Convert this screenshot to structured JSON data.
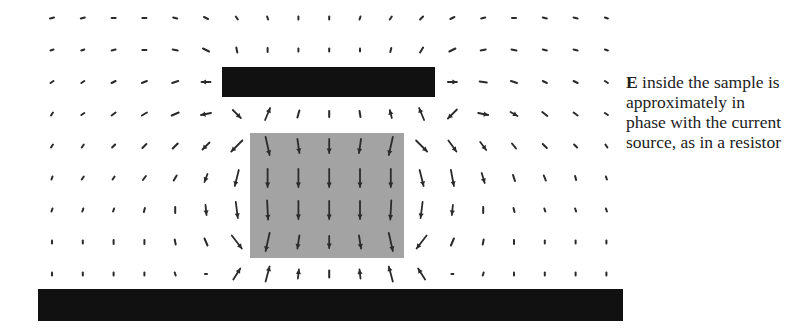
{
  "figure": {
    "caption": {
      "bold_symbol": "E",
      "text": " inside the sample is approximately in phase with the current source, as in a resistor",
      "lines": [
        "E inside the",
        "sample is",
        "approximately",
        "in phase with",
        "the current",
        "source, as in a",
        "resistor"
      ]
    },
    "colors": {
      "plate": "#111111",
      "sample": "#a3a3a3",
      "arrow": "#2a2a2a",
      "background": "#ffffff"
    },
    "top_plate": {
      "x": 222,
      "y": 67,
      "w": 213,
      "h": 30
    },
    "bottom_plate": {
      "x": 38,
      "y": 289,
      "w": 585,
      "h": 32
    },
    "sample": {
      "x": 250,
      "y": 133,
      "w": 154,
      "h": 125
    },
    "grid": {
      "x0": 52,
      "dx": 30.8,
      "cols": 19,
      "y0": 18,
      "dy": 32,
      "rows": 9
    },
    "vectors": [
      [
        [
          -4,
          1
        ],
        [
          -4,
          1
        ],
        [
          -4,
          0
        ],
        [
          -4,
          0
        ],
        [
          -4,
          -1
        ],
        [
          -4,
          -2
        ],
        [
          -2,
          -3
        ],
        [
          -1,
          -3
        ],
        [
          0,
          -3
        ],
        [
          0,
          -3
        ],
        [
          1,
          -3
        ],
        [
          2,
          -3
        ],
        [
          3,
          -3
        ],
        [
          4,
          -2
        ],
        [
          4,
          -1
        ],
        [
          4,
          0
        ],
        [
          4,
          1
        ],
        [
          4,
          1
        ],
        [
          3,
          1
        ]
      ],
      [
        [
          -3,
          1
        ],
        [
          -3,
          1
        ],
        [
          -4,
          1
        ],
        [
          -4,
          0
        ],
        [
          -5,
          -1
        ],
        [
          -6,
          -3
        ],
        [
          -1,
          -5
        ],
        [
          0,
          -4
        ],
        [
          0,
          -3
        ],
        [
          0,
          -3
        ],
        [
          0,
          -3
        ],
        [
          1,
          -4
        ],
        [
          3,
          -5
        ],
        [
          6,
          -3
        ],
        [
          5,
          -1
        ],
        [
          5,
          1
        ],
        [
          4,
          1
        ],
        [
          4,
          1
        ],
        [
          3,
          1
        ]
      ],
      [
        [
          -3,
          2
        ],
        [
          -3,
          2
        ],
        [
          -4,
          2
        ],
        [
          -5,
          2
        ],
        [
          -6,
          2
        ],
        [
          -9,
          0
        ],
        [
          0,
          0
        ],
        [
          0,
          0
        ],
        [
          0,
          0
        ],
        [
          0,
          0
        ],
        [
          0,
          0
        ],
        [
          0,
          0
        ],
        [
          0,
          0
        ],
        [
          9,
          0
        ],
        [
          7,
          1
        ],
        [
          6,
          2
        ],
        [
          4,
          2
        ],
        [
          4,
          2
        ],
        [
          3,
          2
        ]
      ],
      [
        [
          -2,
          3
        ],
        [
          -3,
          2
        ],
        [
          -4,
          3
        ],
        [
          -5,
          3
        ],
        [
          -7,
          3
        ],
        [
          -10,
          2
        ],
        [
          8,
          8
        ],
        [
          5,
          -12
        ],
        [
          2,
          -7
        ],
        [
          0,
          -6
        ],
        [
          -1,
          -6
        ],
        [
          -2,
          -8
        ],
        [
          -5,
          -12
        ],
        [
          -9,
          9
        ],
        [
          10,
          2
        ],
        [
          7,
          4
        ],
        [
          5,
          4
        ],
        [
          4,
          3
        ],
        [
          3,
          2
        ]
      ],
      [
        [
          -2,
          3
        ],
        [
          -2,
          3
        ],
        [
          -3,
          3
        ],
        [
          -4,
          4
        ],
        [
          -5,
          5
        ],
        [
          -7,
          7
        ],
        [
          -11,
          11
        ],
        [
          4,
          18
        ],
        [
          2,
          14
        ],
        [
          0,
          14
        ],
        [
          -2,
          14
        ],
        [
          -4,
          18
        ],
        [
          11,
          11
        ],
        [
          8,
          11
        ],
        [
          6,
          8
        ],
        [
          4,
          5
        ],
        [
          4,
          4
        ],
        [
          3,
          3
        ],
        [
          2,
          3
        ]
      ],
      [
        [
          -1,
          3
        ],
        [
          -2,
          3
        ],
        [
          -2,
          3
        ],
        [
          -3,
          4
        ],
        [
          -3,
          5
        ],
        [
          -3,
          8
        ],
        [
          -4,
          16
        ],
        [
          0,
          18
        ],
        [
          0,
          18
        ],
        [
          0,
          18
        ],
        [
          0,
          18
        ],
        [
          0,
          18
        ],
        [
          4,
          16
        ],
        [
          3,
          16
        ],
        [
          3,
          10
        ],
        [
          2,
          6
        ],
        [
          2,
          5
        ],
        [
          1,
          4
        ],
        [
          1,
          3
        ]
      ],
      [
        [
          -1,
          3
        ],
        [
          -1,
          3
        ],
        [
          -1,
          3
        ],
        [
          -1,
          4
        ],
        [
          0,
          6
        ],
        [
          1,
          10
        ],
        [
          2,
          16
        ],
        [
          1,
          19
        ],
        [
          0,
          18
        ],
        [
          0,
          18
        ],
        [
          0,
          18
        ],
        [
          -1,
          19
        ],
        [
          -2,
          16
        ],
        [
          -1,
          10
        ],
        [
          0,
          6
        ],
        [
          1,
          4
        ],
        [
          1,
          3
        ],
        [
          1,
          3
        ],
        [
          1,
          3
        ]
      ],
      [
        [
          0,
          3
        ],
        [
          0,
          3
        ],
        [
          0,
          4
        ],
        [
          0,
          4
        ],
        [
          1,
          5
        ],
        [
          3,
          7
        ],
        [
          10,
          13
        ],
        [
          -4,
          18
        ],
        [
          -2,
          13
        ],
        [
          0,
          12
        ],
        [
          2,
          13
        ],
        [
          4,
          18
        ],
        [
          -10,
          13
        ],
        [
          -3,
          7
        ],
        [
          -1,
          5
        ],
        [
          0,
          4
        ],
        [
          0,
          3
        ],
        [
          0,
          3
        ],
        [
          0,
          3
        ]
      ],
      [
        [
          0,
          3
        ],
        [
          0,
          3
        ],
        [
          0,
          3
        ],
        [
          0,
          3
        ],
        [
          1,
          3
        ],
        [
          -2,
          0
        ],
        [
          7,
          -11
        ],
        [
          4,
          -15
        ],
        [
          1,
          -9
        ],
        [
          0,
          -7
        ],
        [
          -1,
          -9
        ],
        [
          -4,
          -15
        ],
        [
          -7,
          -11
        ],
        [
          2,
          0
        ],
        [
          -1,
          3
        ],
        [
          0,
          3
        ],
        [
          0,
          3
        ],
        [
          0,
          3
        ],
        [
          0,
          3
        ]
      ]
    ]
  }
}
